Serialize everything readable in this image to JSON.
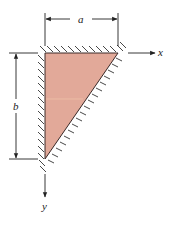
{
  "diagram": {
    "labels": {
      "width_dimension": "a",
      "height_dimension": "b",
      "x_axis": "x",
      "y_axis": "y"
    },
    "colors": {
      "plate_fill": "#e2a999",
      "line": "#222222",
      "hatch": "#333333",
      "background": "#ffffff"
    },
    "geometry": {
      "triangle_vertices": [
        [
          45,
          53
        ],
        [
          118,
          53
        ],
        [
          45,
          159
        ]
      ],
      "x_axis_end": [
        156,
        53
      ],
      "y_axis_end": [
        45,
        198
      ]
    }
  }
}
